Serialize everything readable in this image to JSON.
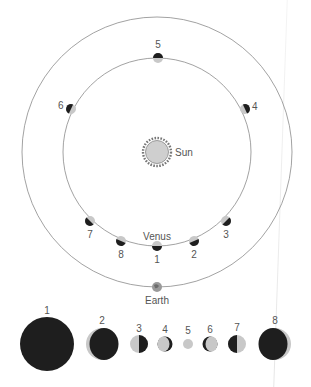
{
  "diagram": {
    "sun_label": "Sun",
    "venus_label": "Venus",
    "earth_label": "Earth",
    "colors": {
      "orbit": "#8a8a8a",
      "dark": "#1e1e1e",
      "lit": "#c8c8c8",
      "sun_fill": "#cfcfcf",
      "text": "#555555"
    },
    "orbit_positions": [
      {
        "n": "1",
        "label": "1"
      },
      {
        "n": "2",
        "label": "2"
      },
      {
        "n": "3",
        "label": "3"
      },
      {
        "n": "4",
        "label": "4"
      },
      {
        "n": "5",
        "label": "5"
      },
      {
        "n": "6",
        "label": "6"
      },
      {
        "n": "7",
        "label": "7"
      },
      {
        "n": "8",
        "label": "8"
      }
    ],
    "phases": [
      {
        "n": "1",
        "label": "1",
        "phase": "new"
      },
      {
        "n": "2",
        "label": "2",
        "phase": "thin crescent"
      },
      {
        "n": "3",
        "label": "3",
        "phase": "half"
      },
      {
        "n": "4",
        "label": "4",
        "phase": "gibbous"
      },
      {
        "n": "5",
        "label": "5",
        "phase": "full"
      },
      {
        "n": "6",
        "label": "6",
        "phase": "gibbous"
      },
      {
        "n": "7",
        "label": "7",
        "phase": "half"
      },
      {
        "n": "8",
        "label": "8",
        "phase": "thin crescent"
      }
    ]
  }
}
